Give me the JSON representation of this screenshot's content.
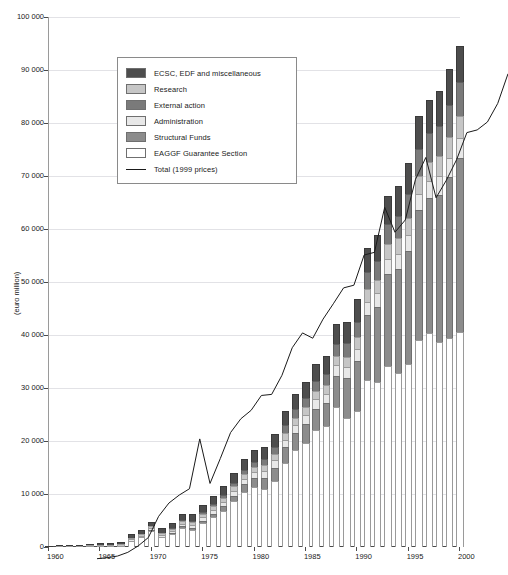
{
  "chart_data": {
    "type": "bar",
    "subtype": "stacked-bar-with-line",
    "title": "",
    "xlabel": "",
    "ylabel": "(euro million)",
    "ylim": [
      0,
      100000
    ],
    "xlim": [
      1960,
      2000
    ],
    "grid": true,
    "y_ticks": [
      "0",
      "10 000",
      "20 000",
      "30 000",
      "40 000",
      "50 000",
      "60 000",
      "70 000",
      "80 000",
      "90 000",
      "100 000"
    ],
    "y_tick_values": [
      0,
      10000,
      20000,
      30000,
      40000,
      50000,
      60000,
      70000,
      80000,
      90000,
      100000
    ],
    "x_ticks": [
      "1960",
      "1965",
      "1970",
      "1975",
      "1980",
      "1985",
      "1990",
      "1995",
      "2000"
    ],
    "x_tick_values": [
      1960,
      1965,
      1970,
      1975,
      1980,
      1985,
      1990,
      1995,
      2000
    ],
    "legend_position": "upper-left-inside",
    "categories": [
      1960,
      1961,
      1962,
      1963,
      1964,
      1965,
      1966,
      1967,
      1968,
      1969,
      1970,
      1971,
      1972,
      1973,
      1974,
      1975,
      1976,
      1977,
      1978,
      1979,
      1980,
      1981,
      1982,
      1983,
      1984,
      1985,
      1986,
      1987,
      1988,
      1989,
      1990,
      1991,
      1992,
      1993,
      1994,
      1995,
      1996,
      1997,
      1998,
      1999,
      2000
    ],
    "series": [
      {
        "name": "EAGGF Guarantee Section",
        "color": "#ffffff",
        "stroke": "#9a9a9a",
        "values": [
          0,
          0,
          0,
          0,
          0,
          0,
          0,
          0,
          1200,
          1800,
          3100,
          1800,
          2400,
          3600,
          3200,
          4500,
          5600,
          6800,
          8600,
          10400,
          11300,
          11000,
          12400,
          15800,
          18300,
          19700,
          22100,
          22900,
          26400,
          24400,
          25600,
          31500,
          31200,
          34100,
          32900,
          34500,
          39100,
          40400,
          38700,
          39500,
          40500
        ]
      },
      {
        "name": "Structural Funds",
        "color": "#8c8c8c",
        "stroke": "#6f6f6f",
        "values": [
          0,
          0,
          0,
          0,
          0,
          0,
          0,
          0,
          0,
          0,
          100,
          150,
          200,
          300,
          400,
          500,
          700,
          900,
          1100,
          1400,
          1700,
          2100,
          2600,
          3000,
          3200,
          3600,
          4000,
          4200,
          5900,
          7400,
          9500,
          12300,
          14100,
          17500,
          19500,
          21300,
          24400,
          25400,
          27800,
          30300,
          32900
        ]
      },
      {
        "name": "Administration",
        "color": "#e8e8e8",
        "stroke": "#9a9a9a",
        "values": [
          60,
          70,
          90,
          120,
          150,
          180,
          210,
          240,
          280,
          320,
          360,
          400,
          450,
          520,
          600,
          680,
          760,
          850,
          940,
          1050,
          1150,
          1250,
          1350,
          1450,
          1550,
          1650,
          1750,
          1850,
          1950,
          2100,
          2250,
          2400,
          2550,
          2700,
          2850,
          3000,
          3150,
          3300,
          3450,
          3600,
          3750
        ]
      },
      {
        "name": "Research",
        "color": "#c6c6c6",
        "stroke": "#9a9a9a",
        "values": [
          0,
          30,
          60,
          100,
          140,
          180,
          220,
          250,
          280,
          310,
          340,
          370,
          400,
          450,
          500,
          550,
          620,
          700,
          780,
          860,
          950,
          1050,
          1150,
          1250,
          1350,
          1450,
          1550,
          1650,
          1800,
          2000,
          2200,
          2400,
          2600,
          2800,
          3000,
          3200,
          3400,
          3600,
          3800,
          4000,
          4200
        ]
      },
      {
        "name": "External action",
        "color": "#7a7a7a",
        "stroke": "#5f5f5f",
        "values": [
          0,
          0,
          0,
          0,
          0,
          0,
          0,
          0,
          0,
          0,
          0,
          0,
          100,
          200,
          300,
          400,
          500,
          600,
          700,
          850,
          1000,
          1150,
          1300,
          1450,
          1600,
          1750,
          1900,
          2100,
          2300,
          2600,
          2900,
          3200,
          3500,
          3900,
          4300,
          4700,
          5100,
          5400,
          5700,
          6000,
          6300
        ]
      },
      {
        "name": "ECSC, EDF and miscellaneous",
        "color": "#4d4d4d",
        "stroke": "#3a3a3a",
        "values": [
          100,
          150,
          200,
          250,
          300,
          350,
          400,
          450,
          700,
          800,
          900,
          950,
          1000,
          1100,
          1200,
          1350,
          1500,
          1650,
          1800,
          2000,
          2200,
          2350,
          2500,
          2650,
          2800,
          3000,
          3200,
          3400,
          3700,
          4000,
          4300,
          4600,
          4900,
          5200,
          5500,
          5800,
          6100,
          6300,
          6500,
          6700,
          6900
        ]
      }
    ],
    "line_series": {
      "name": "Total (1999 prices)",
      "color": "#1a1a1a",
      "values": [
        1000,
        1200,
        1500,
        2200,
        3400,
        5000,
        9000,
        11500,
        13000,
        14200,
        23600,
        15200,
        19900,
        24800,
        27400,
        29000,
        31800,
        32000,
        35600,
        40800,
        43600,
        42600,
        46200,
        49100,
        52100,
        52600,
        58300,
        58800,
        67300,
        62600,
        64900,
        72600,
        76700,
        69100,
        72400,
        76300,
        81400,
        81900,
        83400,
        86900,
        92500
      ]
    }
  },
  "legend": {
    "items": [
      {
        "label": "ECSC, EDF and miscellaneous",
        "swatch": "#4d4d4d",
        "type": "swatch"
      },
      {
        "label": "Research",
        "swatch": "#c6c6c6",
        "type": "swatch"
      },
      {
        "label": "External action",
        "swatch": "#7a7a7a",
        "type": "swatch"
      },
      {
        "label": "Administration",
        "swatch": "#e8e8e8",
        "type": "swatch"
      },
      {
        "label": "Structural Funds",
        "swatch": "#8c8c8c",
        "type": "swatch"
      },
      {
        "label": "EAGGF Guarantee Section",
        "swatch": "#ffffff",
        "type": "swatch"
      },
      {
        "label": "Total (1999 prices)",
        "swatch": "#1a1a1a",
        "type": "line"
      }
    ]
  },
  "axes": {
    "y_axis_title": "(euro million)"
  }
}
